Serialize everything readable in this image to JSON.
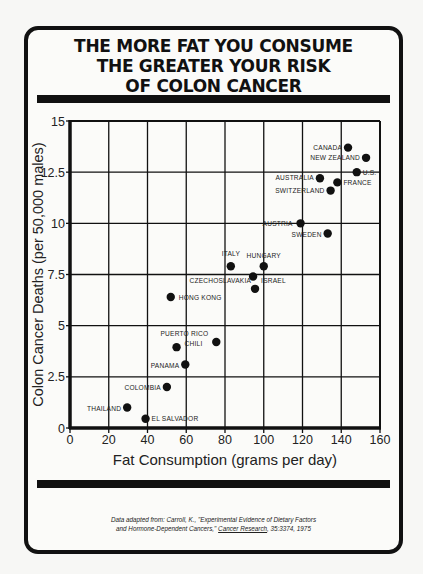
{
  "title": {
    "lines": [
      "THE MORE FAT YOU CONSUME",
      "THE GREATER YOUR RISK",
      "OF COLON CANCER"
    ]
  },
  "citation": {
    "line1": "Data adapted from: Carroll, K., \"Experimental Evidence of Dietary Factors",
    "line2_pre": "and Hormone-Dependent Cancers,\" ",
    "journal": "Cancer Research",
    "line2_post": ", 35:3374, 1975"
  },
  "colors": {
    "ink": "#111111",
    "paper": "#fbfbf9"
  },
  "chart_data": {
    "type": "scatter",
    "title": "THE MORE FAT YOU CONSUME THE GREATER YOUR RISK OF COLON CANCER",
    "xlabel": "Fat Consumption (grams per day)",
    "ylabel": "Colon Cancer Deaths (per 50,000 males)",
    "xlim": [
      0,
      160
    ],
    "ylim": [
      0,
      15
    ],
    "xticks": [
      "0",
      "20",
      "40",
      "60",
      "80",
      "100",
      "120",
      "140",
      "160"
    ],
    "yticks": [
      "0",
      "2.5",
      "5",
      "7.5",
      "10",
      "12.5",
      "15"
    ],
    "grid": true,
    "legend": "none",
    "points": [
      {
        "label": "CANADA",
        "x": 143.5,
        "y": 13.7
      },
      {
        "label": "NEW ZEALAND",
        "x": 152.8,
        "y": 13.2
      },
      {
        "label": "U.S.",
        "x": 148,
        "y": 12.5
      },
      {
        "label": "AUSTRALIA",
        "x": 129,
        "y": 12.2
      },
      {
        "label": "FRANCE",
        "x": 138,
        "y": 12.0
      },
      {
        "label": "SWITZERLAND",
        "x": 134.5,
        "y": 11.6
      },
      {
        "label": "AUSTRIA",
        "x": 119,
        "y": 10.0
      },
      {
        "label": "SWEDEN",
        "x": 133,
        "y": 9.5
      },
      {
        "label": "ITALY",
        "x": 83,
        "y": 7.9
      },
      {
        "label": "HUNGARY",
        "x": 100,
        "y": 7.9
      },
      {
        "label": "ISRAEL",
        "x": 94.5,
        "y": 7.4
      },
      {
        "label": "CZECHOSLAVAKIA",
        "x": 95.5,
        "y": 6.8
      },
      {
        "label": "HONG KONG",
        "x": 52,
        "y": 6.4
      },
      {
        "label": "PUERTO RICO",
        "x": 75.5,
        "y": 4.2
      },
      {
        "label": "CHILI",
        "x": 55,
        "y": 3.95
      },
      {
        "label": "PANAMA",
        "x": 59.5,
        "y": 3.1
      },
      {
        "label": "COLOMBIA",
        "x": 50,
        "y": 2.0
      },
      {
        "label": "THAILAND",
        "x": 29.5,
        "y": 1.0
      },
      {
        "label": "EL SALVADOR",
        "x": 39,
        "y": 0.45
      }
    ]
  }
}
